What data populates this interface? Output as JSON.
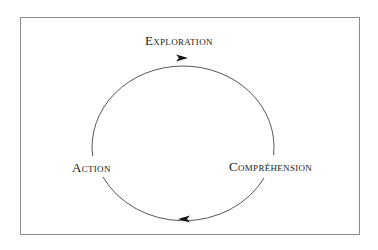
{
  "diagram": {
    "type": "cycle",
    "nodes": [
      {
        "id": "exploration",
        "label": "Exploration",
        "position": "top"
      },
      {
        "id": "comprehension",
        "label": "Compréhension",
        "position": "right"
      },
      {
        "id": "action",
        "label": "Action",
        "position": "left"
      }
    ],
    "edges": [
      {
        "from": "action",
        "to": "exploration",
        "direction": "clockwise"
      },
      {
        "from": "exploration",
        "to": "comprehension",
        "direction": "clockwise"
      },
      {
        "from": "comprehension",
        "to": "action",
        "direction": "clockwise"
      }
    ],
    "arrows": [
      {
        "location": "top",
        "points": "right"
      },
      {
        "location": "bottom",
        "points": "left"
      }
    ],
    "colors": {
      "stroke": "#444444",
      "frame": "#8a8a8a",
      "text": "#1a1a1a",
      "background": "#ffffff"
    }
  },
  "labels": {
    "exploration": "Exploration",
    "action": "Action",
    "comprehension": "Compréhension"
  }
}
